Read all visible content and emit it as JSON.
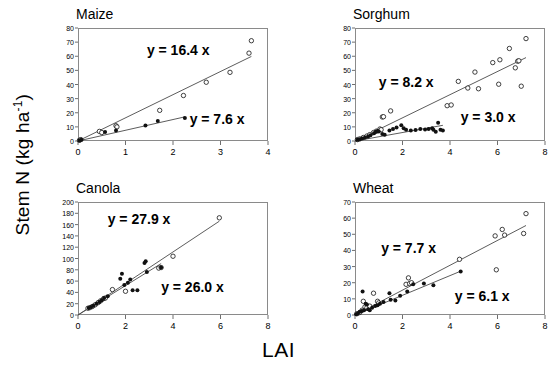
{
  "figure": {
    "xlabel": "LAI",
    "ylabel_text": "Stem N (kg ha",
    "ylabel_sup": "-1",
    "ylabel_tail": ")"
  },
  "chart_data": [
    {
      "type": "scatter",
      "title": "Maize",
      "xlabel": "LAI",
      "ylabel": "Stem N (kg ha-1)",
      "xlim": [
        0,
        4
      ],
      "ylim": [
        0,
        80
      ],
      "xticks": [
        0,
        1,
        2,
        3,
        4
      ],
      "yticks": [
        0,
        10,
        20,
        30,
        40,
        50,
        60,
        70,
        80
      ],
      "grid": false,
      "legend": "none",
      "annotations": [
        {
          "text": "y = 16.4 x",
          "x": 1.45,
          "y": 64
        },
        {
          "text": "y = 7.6 x",
          "x": 2.35,
          "y": 15
        }
      ],
      "series": [
        {
          "name": "open",
          "marker": "open-circle",
          "slope": 16.4,
          "points": [
            [
              0.03,
              0.5
            ],
            [
              0.06,
              1.0
            ],
            [
              0.45,
              6.8
            ],
            [
              0.5,
              6.0
            ],
            [
              0.8,
              10.8
            ],
            [
              0.82,
              10.0
            ],
            [
              1.72,
              21.7
            ],
            [
              2.22,
              32.2
            ],
            [
              2.7,
              41.6
            ],
            [
              3.2,
              48.6
            ],
            [
              3.6,
              62.2
            ],
            [
              3.65,
              71.0
            ]
          ]
        },
        {
          "name": "closed",
          "marker": "closed-circle",
          "slope": 7.6,
          "points": [
            [
              0.03,
              0.4
            ],
            [
              0.07,
              0.8
            ],
            [
              0.57,
              6.4
            ],
            [
              0.8,
              7.4
            ],
            [
              1.42,
              11.0
            ],
            [
              1.68,
              14.2
            ],
            [
              2.25,
              16.3
            ]
          ]
        }
      ]
    },
    {
      "type": "scatter",
      "title": "Sorghum",
      "xlabel": "LAI",
      "ylabel": "Stem N (kg ha-1)",
      "xlim": [
        0,
        8
      ],
      "ylim": [
        0,
        80
      ],
      "xticks": [
        0,
        2,
        4,
        6,
        8
      ],
      "yticks": [
        0,
        10,
        20,
        30,
        40,
        50,
        60,
        70,
        80
      ],
      "grid": false,
      "legend": "none",
      "annotations": [
        {
          "text": "y = 8.2 x",
          "x": 1.0,
          "y": 41
        },
        {
          "text": "y = 3.0 x",
          "x": 4.45,
          "y": 16
        }
      ],
      "series": [
        {
          "name": "open",
          "marker": "open-circle",
          "slope": 8.2,
          "points": [
            [
              0.1,
              1.0
            ],
            [
              0.2,
              1.5
            ],
            [
              0.35,
              2.5
            ],
            [
              0.5,
              3.5
            ],
            [
              0.62,
              4.5
            ],
            [
              0.78,
              6.0
            ],
            [
              0.9,
              7.0
            ],
            [
              1.05,
              8.5
            ],
            [
              1.1,
              8.0
            ],
            [
              1.15,
              17.0
            ],
            [
              1.2,
              17.2
            ],
            [
              1.5,
              21.3
            ],
            [
              3.88,
              25.0
            ],
            [
              4.05,
              25.5
            ],
            [
              4.35,
              42.2
            ],
            [
              4.75,
              37.5
            ],
            [
              5.05,
              48.8
            ],
            [
              5.2,
              37.0
            ],
            [
              5.8,
              55.5
            ],
            [
              6.05,
              40.2
            ],
            [
              6.1,
              57.5
            ],
            [
              6.5,
              65.5
            ],
            [
              6.75,
              51.8
            ],
            [
              6.85,
              56.5
            ],
            [
              6.9,
              56.8
            ],
            [
              7.0,
              38.8
            ],
            [
              7.2,
              72.5
            ]
          ]
        },
        {
          "name": "closed",
          "marker": "closed-circle",
          "slope": 3.0,
          "points": [
            [
              0.1,
              0.8
            ],
            [
              0.2,
              1.2
            ],
            [
              0.3,
              1.8
            ],
            [
              0.42,
              2.5
            ],
            [
              0.55,
              3.2
            ],
            [
              0.65,
              4.0
            ],
            [
              0.8,
              5.5
            ],
            [
              0.88,
              6.5
            ],
            [
              0.95,
              7.0
            ],
            [
              1.0,
              6.8
            ],
            [
              1.15,
              5.0
            ],
            [
              1.25,
              4.5
            ],
            [
              1.45,
              7.5
            ],
            [
              1.6,
              8.5
            ],
            [
              1.75,
              9.5
            ],
            [
              1.95,
              11.2
            ],
            [
              2.05,
              9.0
            ],
            [
              2.15,
              8.0
            ],
            [
              2.35,
              7.5
            ],
            [
              2.55,
              7.8
            ],
            [
              2.75,
              8.5
            ],
            [
              2.95,
              8.2
            ],
            [
              3.1,
              8.5
            ],
            [
              3.25,
              9.0
            ],
            [
              3.3,
              8.0
            ],
            [
              3.4,
              6.5
            ],
            [
              3.5,
              13.0
            ],
            [
              3.6,
              8.0
            ],
            [
              3.7,
              7.5
            ]
          ]
        }
      ]
    },
    {
      "type": "scatter",
      "title": "Canola",
      "xlabel": "LAI",
      "ylabel": "Stem N (kg ha-1)",
      "xlim": [
        0,
        8
      ],
      "ylim": [
        0,
        200
      ],
      "xticks": [
        0,
        2,
        4,
        6,
        8
      ],
      "yticks": [
        0,
        20,
        40,
        60,
        80,
        100,
        120,
        140,
        160,
        180,
        200
      ],
      "grid": false,
      "legend": "none",
      "annotations": [
        {
          "text": "y = 27.9 x",
          "x": 1.25,
          "y": 168
        },
        {
          "text": "y = 26.0 x",
          "x": 3.5,
          "y": 48
        }
      ],
      "series": [
        {
          "name": "open",
          "marker": "open-circle",
          "slope": 27.9,
          "points": [
            [
              0.42,
              12.0
            ],
            [
              0.5,
              13.0
            ],
            [
              0.6,
              15.0
            ],
            [
              0.72,
              18.0
            ],
            [
              0.85,
              22.0
            ],
            [
              0.95,
              25.0
            ],
            [
              1.08,
              29.0
            ],
            [
              1.15,
              30.0
            ],
            [
              1.45,
              45.0
            ],
            [
              2.0,
              42.0
            ],
            [
              3.4,
              83.0
            ],
            [
              3.5,
              84.0
            ],
            [
              4.0,
              104.0
            ],
            [
              5.95,
              172.0
            ]
          ]
        },
        {
          "name": "closed",
          "marker": "closed-circle",
          "slope": 26.0,
          "points": [
            [
              0.45,
              12.5
            ],
            [
              0.55,
              14.0
            ],
            [
              0.65,
              16.5
            ],
            [
              0.78,
              20.0
            ],
            [
              0.9,
              23.0
            ],
            [
              1.0,
              26.0
            ],
            [
              1.1,
              30.0
            ],
            [
              1.25,
              33.0
            ],
            [
              1.78,
              64.0
            ],
            [
              1.85,
              73.0
            ],
            [
              1.95,
              53.0
            ],
            [
              2.1,
              57.0
            ],
            [
              2.2,
              63.0
            ],
            [
              2.3,
              44.0
            ],
            [
              2.5,
              44.0
            ],
            [
              2.8,
              92.0
            ],
            [
              2.85,
              95.0
            ],
            [
              2.9,
              76.0
            ],
            [
              3.5,
              84.0
            ]
          ]
        }
      ]
    },
    {
      "type": "scatter",
      "title": "Wheat",
      "xlabel": "LAI",
      "ylabel": "Stem N (kg ha-1)",
      "xlim": [
        0,
        8
      ],
      "ylim": [
        0,
        70
      ],
      "xticks": [
        0,
        2,
        4,
        6,
        8
      ],
      "yticks": [
        0,
        10,
        20,
        30,
        40,
        50,
        60,
        70
      ],
      "grid": false,
      "legend": "none",
      "annotations": [
        {
          "text": "y = 7.7 x",
          "x": 1.1,
          "y": 41
        },
        {
          "text": "y = 6.1 x",
          "x": 4.2,
          "y": 11
        }
      ],
      "series": [
        {
          "name": "open",
          "marker": "open-circle",
          "slope": 7.7,
          "points": [
            [
              0.08,
              0.8
            ],
            [
              0.2,
              1.5
            ],
            [
              0.3,
              3.0
            ],
            [
              0.35,
              8.5
            ],
            [
              0.42,
              5.0
            ],
            [
              0.5,
              4.5
            ],
            [
              0.62,
              5.5
            ],
            [
              0.78,
              13.5
            ],
            [
              0.95,
              8.5
            ],
            [
              1.0,
              7.5
            ],
            [
              2.15,
              19.0
            ],
            [
              2.25,
              23.0
            ],
            [
              2.3,
              19.5
            ],
            [
              2.38,
              20.0
            ],
            [
              4.4,
              34.5
            ],
            [
              5.9,
              49.0
            ],
            [
              5.95,
              28.0
            ],
            [
              6.2,
              53.0
            ],
            [
              6.3,
              49.5
            ],
            [
              7.1,
              50.5
            ],
            [
              7.2,
              62.8
            ]
          ]
        },
        {
          "name": "closed",
          "marker": "closed-circle",
          "slope": 6.1,
          "points": [
            [
              0.05,
              0.5
            ],
            [
              0.12,
              1.0
            ],
            [
              0.2,
              2.0
            ],
            [
              0.28,
              2.5
            ],
            [
              0.32,
              14.5
            ],
            [
              0.38,
              3.0
            ],
            [
              0.45,
              7.0
            ],
            [
              0.5,
              6.5
            ],
            [
              0.55,
              3.5
            ],
            [
              0.62,
              3.0
            ],
            [
              0.72,
              4.5
            ],
            [
              0.85,
              5.5
            ],
            [
              0.95,
              6.0
            ],
            [
              1.05,
              7.0
            ],
            [
              1.2,
              8.0
            ],
            [
              1.45,
              13.5
            ],
            [
              1.5,
              9.5
            ],
            [
              1.7,
              9.0
            ],
            [
              1.9,
              12.0
            ],
            [
              2.2,
              14.5
            ],
            [
              2.45,
              19.0
            ],
            [
              2.9,
              19.5
            ],
            [
              3.3,
              18.5
            ],
            [
              4.45,
              27.0
            ]
          ]
        }
      ]
    }
  ]
}
